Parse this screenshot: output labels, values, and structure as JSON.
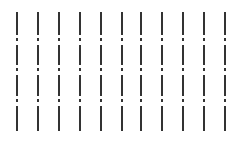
{
  "pattern": {
    "background": "#ffffff",
    "line_color": "#333333",
    "line_width": 2,
    "line_x_positions": [
      16,
      37,
      58,
      79,
      100,
      121,
      140,
      161,
      182,
      203,
      224
    ],
    "segments": [
      {
        "y": 12,
        "h": 23
      },
      {
        "y": 38,
        "h": 3
      },
      {
        "y": 45,
        "h": 20
      },
      {
        "y": 68,
        "h": 3
      },
      {
        "y": 75,
        "h": 21
      },
      {
        "y": 99,
        "h": 3
      },
      {
        "y": 106,
        "h": 25
      }
    ]
  }
}
